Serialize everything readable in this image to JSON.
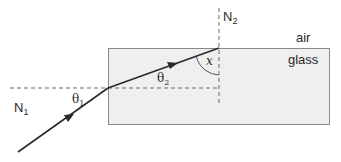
{
  "diagram": {
    "colors": {
      "glass_fill": "#efefef",
      "glass_border": "#8a8a8a",
      "ray": "#2a2a2a",
      "normal_dash": "#6a6a6a",
      "text": "#2a2a2a"
    },
    "labels": {
      "normal_1": {
        "main": "N",
        "sub": "1"
      },
      "normal_2": {
        "main": "N",
        "sub": "2"
      },
      "theta_1": {
        "main": "θ",
        "sub": "1"
      },
      "theta_2": {
        "main": "θ",
        "sub": "2"
      },
      "angle_x": "x",
      "medium_top": "air",
      "medium_block": "glass"
    }
  }
}
